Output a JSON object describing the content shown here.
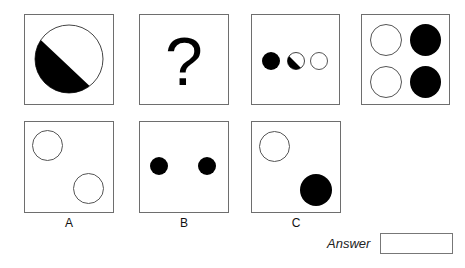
{
  "puzzle": {
    "sequence": [
      {
        "id": "seq-1",
        "content": "large circle half black (lower-left) half white, diagonal split"
      },
      {
        "id": "seq-2",
        "content": "question mark",
        "glyph": "?"
      },
      {
        "id": "seq-3",
        "content": "three small circles in a row: black, half black/white, white"
      },
      {
        "id": "seq-4",
        "content": "2x2 grid: white, black / white, black"
      }
    ],
    "options": [
      {
        "label": "A",
        "content": "two white circles, top-left and bottom-right"
      },
      {
        "label": "B",
        "content": "two small black circles side by side"
      },
      {
        "label": "C",
        "content": "white circle top-left, black circle bottom-right"
      }
    ]
  },
  "answer": {
    "label": "Answer",
    "value": ""
  },
  "colors": {
    "border": "#6e6e6e",
    "fill_black": "#000000",
    "background": "#ffffff"
  }
}
